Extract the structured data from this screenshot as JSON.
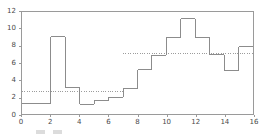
{
  "chart_data": {
    "type": "line",
    "title": "",
    "subtitle": "",
    "xlabel": "",
    "ylabel": "",
    "xlim": [
      0,
      16
    ],
    "ylim": [
      0,
      12
    ],
    "grid": false,
    "legend_position": "none",
    "drawstyle": "steps-post",
    "x_ticks": [
      0,
      2,
      4,
      6,
      8,
      10,
      12,
      14,
      16
    ],
    "x_tick_labels": [
      "0",
      "2",
      "4",
      "6",
      "8",
      "10",
      "12",
      "14",
      "16"
    ],
    "y_ticks": [
      0,
      2,
      4,
      6,
      8,
      10,
      12
    ],
    "y_tick_labels": [
      "0",
      "2",
      "4",
      "6",
      "8",
      "10",
      "12"
    ],
    "line_color": "#8a8a8a",
    "reference_color": "#9a9a9a",
    "axis_color": "#9a9a9a",
    "tick_label_color": "#4a4a4a",
    "series": [
      {
        "name": "step-series",
        "style": "steps-post",
        "x": [
          0,
          1,
          2,
          3,
          4,
          5,
          6,
          7,
          8,
          9,
          10,
          11,
          12,
          13,
          14,
          15,
          16
        ],
        "values": [
          1.2,
          1.2,
          9.1,
          3.1,
          1.15,
          1.6,
          1.95,
          3.0,
          5.2,
          6.9,
          9.0,
          11.2,
          9.0,
          7.0,
          5.1,
          7.9,
          7.9
        ]
      }
    ],
    "reference_lines": [
      {
        "name": "left-mean",
        "value": 2.7,
        "x_start": 0,
        "x_end": 7,
        "style": "dotted"
      },
      {
        "name": "right-mean",
        "value": 7.1,
        "x_start": 7,
        "x_end": 16,
        "style": "dotted"
      }
    ],
    "steps": [
      {
        "x_start": 0,
        "x_end": 2,
        "value": 1.2
      },
      {
        "x_start": 2,
        "x_end": 3,
        "value": 9.1
      },
      {
        "x_start": 3,
        "x_end": 4,
        "value": 3.1
      },
      {
        "x_start": 4,
        "x_end": 5,
        "value": 1.15
      },
      {
        "x_start": 5,
        "x_end": 6,
        "value": 1.6
      },
      {
        "x_start": 6,
        "x_end": 7,
        "value": 1.95
      },
      {
        "x_start": 7,
        "x_end": 8,
        "value": 3.0
      },
      {
        "x_start": 8,
        "x_end": 9,
        "value": 5.2
      },
      {
        "x_start": 9,
        "x_end": 10,
        "value": 6.9
      },
      {
        "x_start": 10,
        "x_end": 11,
        "value": 9.0
      },
      {
        "x_start": 11,
        "x_end": 12,
        "value": 11.2
      },
      {
        "x_start": 12,
        "x_end": 13,
        "value": 9.0
      },
      {
        "x_start": 13,
        "x_end": 14,
        "value": 7.0
      },
      {
        "x_start": 14,
        "x_end": 15,
        "value": 5.1
      },
      {
        "x_start": 15,
        "x_end": 16,
        "value": 7.9
      }
    ]
  },
  "caption": {
    "legend_label": "",
    "note": ""
  }
}
